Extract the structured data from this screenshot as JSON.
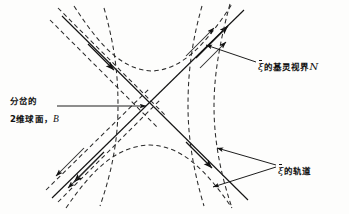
{
  "figure": {
    "type": "physics-spacetime-diagram",
    "colors": {
      "ink": "#111111",
      "background": "#fdfdfc",
      "solid_line": "#1a1a1a",
      "dashed_line": "#2a2a2a"
    },
    "bifurcation_point": {
      "x": 150,
      "y": 105
    },
    "solid_lines": [
      {
        "name": "horizon-branch-nw-se",
        "x1": 62,
        "y1": 16,
        "x2": 248,
        "y2": 200
      },
      {
        "name": "horizon-branch-sw-ne",
        "x1": 52,
        "y1": 198,
        "x2": 244,
        "y2": 10
      }
    ],
    "arrow_directions": {
      "upper_right": "up-right",
      "lower_left": "down-left",
      "upper_left": "none",
      "lower_right": "up-right"
    }
  },
  "labels": {
    "horizon": {
      "field": "ξ",
      "text": "的基灵视界",
      "symbol": "N",
      "full": "ξ̄的基灵视界 N",
      "meaning": "Killing horizon of xi-bar"
    },
    "orbits": {
      "field": "ξ",
      "text": "的轨道",
      "full": "ξ̄的轨道",
      "meaning": "orbits of xi-bar"
    },
    "bifurcation": {
      "line1": "分岔的",
      "line2_prefix": "2维球面，",
      "symbol": "B",
      "full": "分岔的2维球面，B",
      "meaning": "bifurcation 2-sphere, B"
    }
  },
  "leaders": [
    {
      "name": "leader-horizon",
      "from": [
        256,
        62
      ],
      "to": [
        205,
        45
      ]
    },
    {
      "name": "leader-orbit-upper",
      "from": [
        276,
        166
      ],
      "to": [
        216,
        148
      ]
    },
    {
      "name": "leader-orbit-lower",
      "from": [
        276,
        168
      ],
      "to": [
        212,
        188
      ]
    },
    {
      "name": "leader-bifurcation",
      "from": [
        57,
        106
      ],
      "to": [
        147,
        106
      ]
    }
  ]
}
